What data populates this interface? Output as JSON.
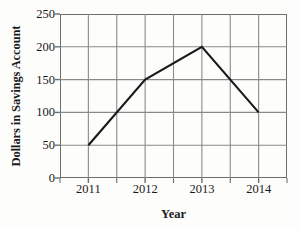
{
  "chart_data": {
    "type": "line",
    "title": "",
    "xlabel": "Year",
    "ylabel": "Dollars in Savings Account",
    "categories": [
      "2011",
      "2012",
      "2013",
      "2014"
    ],
    "x": [
      2011,
      2012,
      2013,
      2014
    ],
    "values": [
      50,
      150,
      200,
      100
    ],
    "series": [
      {
        "name": "Dollars in Savings Account",
        "values": [
          50,
          150,
          200,
          100
        ]
      }
    ],
    "xlim": [
      2010.5,
      2014.5
    ],
    "ylim": [
      0,
      250
    ],
    "ytick_labels": [
      "0",
      "50",
      "100",
      "150",
      "200",
      "250"
    ],
    "ytick_values": [
      0,
      50,
      100,
      150,
      200,
      250
    ],
    "xtick_labels": [
      "2011",
      "2012",
      "2013",
      "2014"
    ],
    "xtick_values": [
      2011,
      2012,
      2013,
      2014
    ],
    "grid": true,
    "grid_x_minor": true,
    "legend": false,
    "legend_position": "none",
    "line_color": "#1a1a1a",
    "grid_color": "#8a8a8a",
    "axis_color": "#6e6e6e",
    "background_color": "#fdfdfc"
  },
  "axes": {
    "y_title": "Dollars in Savings Account",
    "x_title": "Year"
  }
}
